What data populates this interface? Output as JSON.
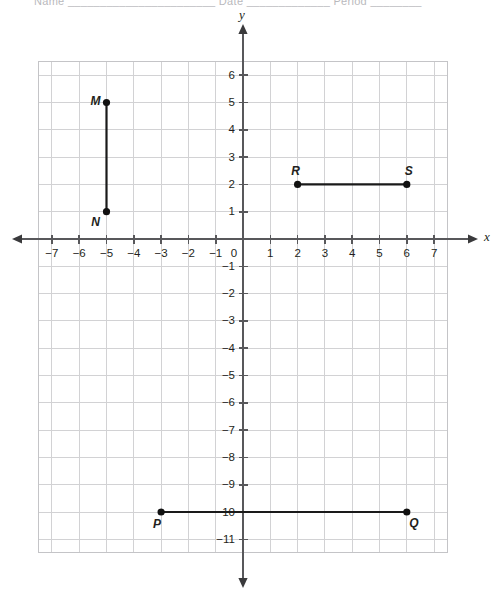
{
  "page": {
    "top_cut_text": "Name _______________________  Date _____________  Period ________"
  },
  "chart_data": {
    "type": "scatter",
    "title": "",
    "xlabel": "x",
    "ylabel": "y",
    "grid": true,
    "legend": false,
    "xlim": [
      -7.5,
      7.5
    ],
    "ylim": [
      -11.5,
      6.5
    ],
    "x_ticks": [
      -7,
      -6,
      -5,
      -4,
      -3,
      -2,
      -1,
      0,
      1,
      2,
      3,
      4,
      5,
      6,
      7
    ],
    "y_ticks": [
      6,
      5,
      4,
      3,
      2,
      1,
      -1,
      -2,
      -3,
      -4,
      -5,
      -6,
      -7,
      -8,
      -9,
      -10,
      -11
    ],
    "origin_label": "0",
    "x_tick_labels": [
      "−7",
      "−6",
      "−5",
      "−4",
      "−3",
      "−2",
      "−1",
      "1",
      "2",
      "3",
      "4",
      "5",
      "6",
      "7"
    ],
    "y_tick_labels": [
      "6",
      "5",
      "4",
      "3",
      "2",
      "1",
      "−1",
      "−2",
      "−3",
      "−4",
      "−5",
      "−6",
      "−7",
      "−8",
      "−9",
      "−10",
      "−11"
    ],
    "points": [
      {
        "label": "M",
        "x": -5,
        "y": 5,
        "label_dx": -11,
        "label_dy": -1
      },
      {
        "label": "N",
        "x": -5,
        "y": 1,
        "label_dx": -11,
        "label_dy": 11
      },
      {
        "label": "R",
        "x": 2,
        "y": 2,
        "label_dx": -2,
        "label_dy": -13
      },
      {
        "label": "S",
        "x": 6,
        "y": 2,
        "label_dx": 2,
        "label_dy": -13
      },
      {
        "label": "P",
        "x": -3,
        "y": -10,
        "label_dx": -4,
        "label_dy": 13
      },
      {
        "label": "Q",
        "x": 6,
        "y": -10,
        "label_dx": 7,
        "label_dy": 12
      }
    ],
    "segments": [
      {
        "name": "MN",
        "from": "M",
        "to": "N",
        "x1": -5,
        "y1": 5,
        "x2": -5,
        "y2": 1
      },
      {
        "name": "RS",
        "from": "R",
        "to": "S",
        "x1": 2,
        "y1": 2,
        "x2": 6,
        "y2": 2
      },
      {
        "name": "PQ",
        "from": "P",
        "to": "Q",
        "x1": -3,
        "y1": -10,
        "x2": 6,
        "y2": -10
      }
    ],
    "colors": {
      "grid": "#d2d2d4",
      "axis": "#58585b",
      "segment": "#1a1a1a",
      "text": "#231f20"
    }
  }
}
